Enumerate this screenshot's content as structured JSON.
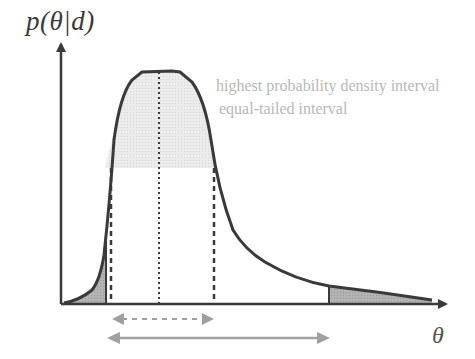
{
  "diagram": {
    "y_axis_label": "p(θ|d)",
    "x_axis_label": "θ",
    "legend": {
      "hpd": "highest probability density interval",
      "equal_tailed": "equal-tailed interval"
    },
    "colors": {
      "curve": "#3a3a3a",
      "axis": "#3a3a3a",
      "hpd_fill": "#e6e6e6",
      "tail_fill": "#a9a9a9",
      "interval_arrows": "#a0a0a0",
      "legend_text": "#b8b8b8"
    },
    "elements": [
      "skewed posterior density curve",
      "shaded HPD region above density threshold",
      "shaded left and right tails (equal-tailed)",
      "dashed vertical lines at HPD bounds",
      "dotted vertical line at mode",
      "dashed double arrow = HPD interval",
      "solid double arrow = equal-tailed interval"
    ]
  }
}
